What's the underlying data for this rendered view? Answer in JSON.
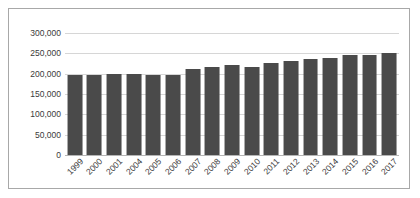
{
  "chart_data": {
    "type": "bar",
    "title": "",
    "xlabel": "",
    "ylabel": "",
    "ylim": [
      0,
      300000
    ],
    "ytick_values": [
      0,
      50000,
      100000,
      150000,
      200000,
      250000,
      300000
    ],
    "ytick_labels": [
      "0",
      "50,000",
      "100,000",
      "150,000",
      "200,000",
      "250,000",
      "300,000"
    ],
    "grid": true,
    "legend": "none",
    "bar_color": "#4a4a4a",
    "gridline_color": "#d6d6d6",
    "border_color": "#a8a8a8",
    "background_color": "#ffffff",
    "categories": [
      "1999",
      "2000",
      "2001",
      "2004",
      "2005",
      "2006",
      "2007",
      "2008",
      "2009",
      "2010",
      "2011",
      "2012",
      "2013",
      "2014",
      "2015",
      "2016",
      "2017"
    ],
    "values": [
      197000,
      197000,
      200000,
      200000,
      196000,
      197000,
      211000,
      216000,
      222000,
      217000,
      227000,
      231000,
      236000,
      239000,
      245000,
      245000,
      252000
    ]
  }
}
